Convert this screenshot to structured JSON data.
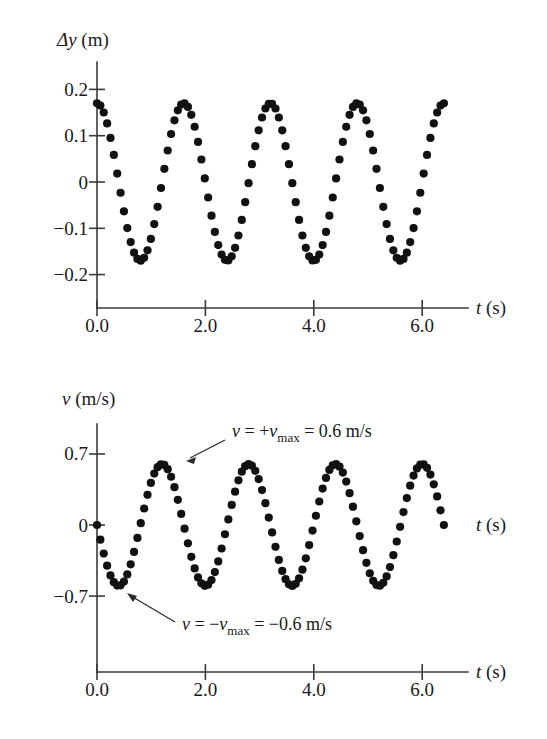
{
  "figure": {
    "background": "#ffffff",
    "point_color": "#111111",
    "axis_color": "#3a3a3a"
  },
  "chart_data": [
    {
      "id": "displacement",
      "type": "scatter",
      "title": "",
      "xlabel": "t (s)",
      "ylabel": "Δy (m)",
      "ylabel_symbol": "Δy",
      "ylabel_unit": "(m)",
      "xlabel_symbol": "t",
      "xlabel_unit": "(s)",
      "xlim": [
        0.0,
        6.6
      ],
      "ylim": [
        -0.24,
        0.22
      ],
      "xticks": [
        0.0,
        2.0,
        4.0,
        6.0
      ],
      "xticklabels": [
        "0.0",
        "2.0",
        "4.0",
        "6.0"
      ],
      "yticks": [
        0.2,
        0.1,
        0,
        -0.1,
        -0.2
      ],
      "yticklabels": [
        "0.2",
        "0.1",
        "0",
        "−0.1",
        "−0.2"
      ],
      "grid": false,
      "legend": "none",
      "waveform": {
        "form": "cosine",
        "amplitude": 0.17,
        "period": 1.6,
        "phase_deg": 0,
        "offset": 0.0,
        "t_start": 0.0,
        "t_end": 6.4,
        "n_points": 104
      },
      "annotations": []
    },
    {
      "id": "velocity",
      "type": "scatter",
      "title": "",
      "xlabel": "t (s)",
      "ylabel": "v (m/s)",
      "ylabel_symbol": "v",
      "ylabel_unit": "(m/s)",
      "xlabel_symbol": "t",
      "xlabel_unit": "(s)",
      "xlim": [
        0.0,
        6.6
      ],
      "ylim": [
        -0.82,
        0.82
      ],
      "xticks": [
        0.0,
        2.0,
        4.0,
        6.0
      ],
      "xticklabels": [
        "0.0",
        "2.0",
        "4.0",
        "6.0"
      ],
      "yticks": [
        0.7,
        0,
        -0.7
      ],
      "yticklabels": [
        "0.7",
        "0",
        "−0.7"
      ],
      "grid": false,
      "legend": "none",
      "waveform": {
        "form": "negative-sine",
        "amplitude": 0.6,
        "period": 1.6,
        "phase_deg": 0,
        "offset": 0.0,
        "t_start": 0.0,
        "t_end": 6.4,
        "n_points": 104
      },
      "annotations": [
        {
          "id": "vmax-positive",
          "parts": [
            {
              "text": "v",
              "style": "italic"
            },
            {
              "text": " = +",
              "style": "normal"
            },
            {
              "text": "v",
              "style": "italic"
            },
            {
              "text": "max",
              "style": "sub"
            },
            {
              "text": " = 0.6 m/s",
              "style": "normal"
            }
          ],
          "plain": "v = +vmax = 0.6 m/s",
          "value": 0.6,
          "points_to_t": 1.2,
          "points_to_v": 0.6
        },
        {
          "id": "vmax-negative",
          "parts": [
            {
              "text": "v",
              "style": "italic"
            },
            {
              "text": " = −",
              "style": "normal"
            },
            {
              "text": "v",
              "style": "italic"
            },
            {
              "text": "max",
              "style": "sub"
            },
            {
              "text": " = −0.6 m/s",
              "style": "normal"
            }
          ],
          "plain": "v = -vmax = -0.6 m/s",
          "value": -0.6,
          "points_to_t": 0.4,
          "points_to_v": -0.6
        }
      ],
      "extra_axis_labels": [
        {
          "id": "t-label-zero-level",
          "symbol": "t",
          "unit": "(s)"
        }
      ]
    }
  ]
}
